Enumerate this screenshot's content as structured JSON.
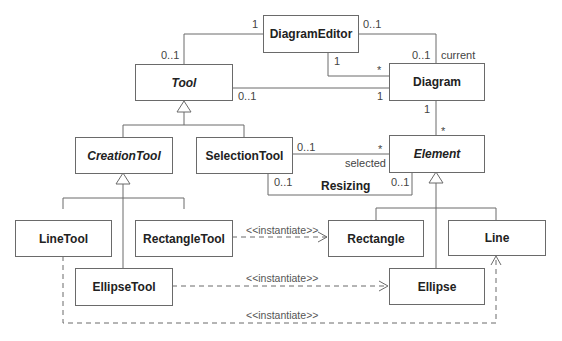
{
  "diagram": {
    "type": "UML class diagram",
    "classes": [
      {
        "id": "DiagramEditor",
        "label": "DiagramEditor",
        "abstract": false
      },
      {
        "id": "Tool",
        "label": "Tool",
        "abstract": true
      },
      {
        "id": "Diagram",
        "label": "Diagram",
        "abstract": false
      },
      {
        "id": "CreationTool",
        "label": "CreationTool",
        "abstract": true
      },
      {
        "id": "SelectionTool",
        "label": "SelectionTool",
        "abstract": false
      },
      {
        "id": "Element",
        "label": "Element",
        "abstract": true
      },
      {
        "id": "LineTool",
        "label": "LineTool",
        "abstract": false
      },
      {
        "id": "RectangleTool",
        "label": "RectangleTool",
        "abstract": false
      },
      {
        "id": "Rectangle",
        "label": "Rectangle",
        "abstract": false
      },
      {
        "id": "Line",
        "label": "Line",
        "abstract": false
      },
      {
        "id": "EllipseTool",
        "label": "EllipseTool",
        "abstract": false
      },
      {
        "id": "Ellipse",
        "label": "Ellipse",
        "abstract": false
      }
    ],
    "associations": [
      {
        "from": "DiagramEditor",
        "to": "Tool",
        "from_mult": "1",
        "to_mult": "0..1"
      },
      {
        "from": "DiagramEditor",
        "to": "Diagram",
        "from_mult": "0..1",
        "to_mult": "0..1",
        "role": "current"
      },
      {
        "from": "DiagramEditor",
        "to": "Diagram",
        "from_mult": "1",
        "to_mult": "*"
      },
      {
        "from": "Tool",
        "to": "Diagram",
        "from_mult": "0..1",
        "to_mult": "1"
      },
      {
        "from": "Diagram",
        "to": "Element",
        "from_mult": "1",
        "to_mult": "*"
      },
      {
        "from": "SelectionTool",
        "to": "Element",
        "from_mult": "0..1",
        "to_mult": "*",
        "role": "selected"
      },
      {
        "from": "SelectionTool",
        "to": "Element",
        "from_mult": "0..1",
        "to_mult": "0..1",
        "name": "Resizing"
      }
    ],
    "generalizations": [
      {
        "child": "CreationTool",
        "parent": "Tool"
      },
      {
        "child": "SelectionTool",
        "parent": "Tool"
      },
      {
        "child": "LineTool",
        "parent": "CreationTool"
      },
      {
        "child": "RectangleTool",
        "parent": "CreationTool"
      },
      {
        "child": "EllipseTool",
        "parent": "CreationTool"
      },
      {
        "child": "Rectangle",
        "parent": "Element"
      },
      {
        "child": "Line",
        "parent": "Element"
      },
      {
        "child": "Ellipse",
        "parent": "Element"
      }
    ],
    "dependencies": [
      {
        "from": "RectangleTool",
        "to": "Rectangle",
        "stereotype": "<<instantiate>>"
      },
      {
        "from": "EllipseTool",
        "to": "Ellipse",
        "stereotype": "<<instantiate>>"
      },
      {
        "from": "LineTool",
        "to": "Line",
        "stereotype": "<<instantiate>>"
      }
    ],
    "labels": {
      "m_editor_tool_editor": "1",
      "m_editor_tool_tool": "0..1",
      "m_editor_current_editor": "0..1",
      "m_editor_current_diagram": "0..1",
      "role_current": "current",
      "m_editor_diagrams_editor": "1",
      "m_editor_diagrams_diagram": "*",
      "m_tool_diagram_tool": "0..1",
      "m_tool_diagram_diagram": "1",
      "m_diagram_element_diagram": "1",
      "m_diagram_element_element": "*",
      "m_sel_element_sel": "0..1",
      "m_sel_element_element": "*",
      "role_selected": "selected",
      "m_resize_sel": "0..1",
      "m_resize_element": "0..1",
      "assoc_resizing": "Resizing",
      "stereo_rect": "<<instantiate>>",
      "stereo_ellipse": "<<instantiate>>",
      "stereo_line": "<<instantiate>>"
    }
  }
}
